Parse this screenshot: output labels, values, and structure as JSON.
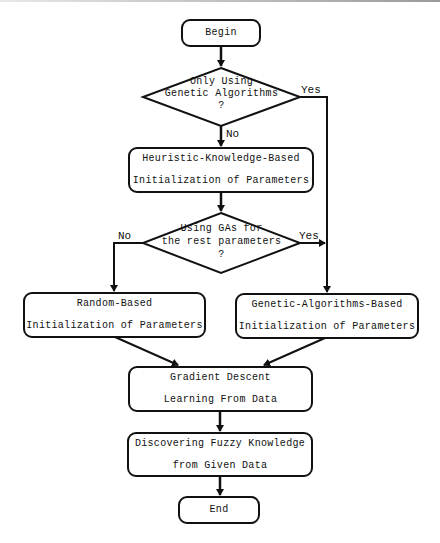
{
  "diagram": {
    "type": "flowchart",
    "colors": {
      "stroke": "#111111",
      "background": "#ffffff",
      "text": "#111111"
    },
    "nodes": {
      "begin": {
        "shape": "terminal",
        "label": "Begin"
      },
      "decision1": {
        "shape": "decision",
        "lines": [
          "Only Using",
          "Genetic Algorithms",
          "?"
        ]
      },
      "heuristic": {
        "shape": "process",
        "lines": [
          "Heuristic-Knowledge-Based",
          "Initialization of Parameters"
        ]
      },
      "decision2": {
        "shape": "decision",
        "lines": [
          "Using GAs for",
          "the rest parameters",
          "?"
        ]
      },
      "random": {
        "shape": "process",
        "lines": [
          "Random-Based",
          "Initialization of Parameters"
        ]
      },
      "genetic": {
        "shape": "process",
        "lines": [
          "Genetic-Algorithms-Based",
          "Initialization of Parameters"
        ]
      },
      "gradient": {
        "shape": "process",
        "lines": [
          "Gradient Descent",
          "Learning From Data"
        ]
      },
      "discover": {
        "shape": "process",
        "lines": [
          "Discovering Fuzzy Knowledge",
          "from Given Data"
        ]
      },
      "end": {
        "shape": "terminal",
        "label": "End"
      }
    },
    "edges": [
      {
        "from": "begin",
        "to": "decision1",
        "label": ""
      },
      {
        "from": "decision1",
        "to": "heuristic",
        "label": "No"
      },
      {
        "from": "decision1",
        "to": "genetic",
        "label": "Yes"
      },
      {
        "from": "heuristic",
        "to": "decision2",
        "label": ""
      },
      {
        "from": "decision2",
        "to": "random",
        "label": "No"
      },
      {
        "from": "decision2",
        "to": "genetic",
        "label": "Yes"
      },
      {
        "from": "random",
        "to": "gradient",
        "label": ""
      },
      {
        "from": "genetic",
        "to": "gradient",
        "label": ""
      },
      {
        "from": "gradient",
        "to": "discover",
        "label": ""
      },
      {
        "from": "discover",
        "to": "end",
        "label": ""
      }
    ],
    "edge_labels": {
      "d1_yes": "Yes",
      "d1_no": "No",
      "d2_yes": "Yes",
      "d2_no": "No"
    }
  }
}
